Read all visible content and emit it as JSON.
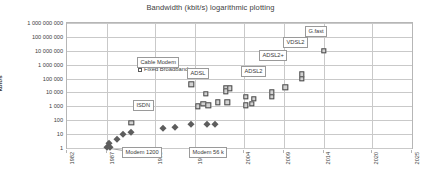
{
  "chart_data": {
    "type": "scatter",
    "title": "Bandwidth (kbit/s) logarithmic plotting",
    "xlabel": "",
    "ylabel": "kbit/s",
    "yscale": "log",
    "ylim": [
      1,
      1000000000
    ],
    "xlim": [
      1982,
      2025
    ],
    "grid": true,
    "legend_position": "top-left-inside",
    "ytick_labels": [
      "1 000 000 000",
      "100 000 000",
      "10 000 000",
      "1 000 000",
      "100 000",
      "10 000",
      "1 000",
      "100",
      "10",
      "1"
    ],
    "ytick_values": [
      1000000000,
      100000000,
      10000000,
      1000000,
      100000,
      10000,
      1000,
      100,
      10,
      1
    ],
    "xtick_labels": [
      "1982",
      "1987",
      "1993",
      "1998",
      "2004",
      "2009",
      "2014",
      "2020",
      "2025"
    ],
    "xtick_values": [
      1982,
      1987,
      1993,
      1998,
      2004,
      2009,
      2014,
      2020,
      2025
    ],
    "series": [
      {
        "name": "Modem",
        "marker": "diamond",
        "color": "#5d5d5d",
        "points": [
          {
            "x": 1987.0,
            "y": 1.2
          },
          {
            "x": 1987.2,
            "y": 2.4
          },
          {
            "x": 1987.4,
            "y": 1.2
          },
          {
            "x": 1988.2,
            "y": 4.8
          },
          {
            "x": 1989.0,
            "y": 9.6
          },
          {
            "x": 1990.0,
            "y": 14.4
          },
          {
            "x": 1994.0,
            "y": 28.8
          },
          {
            "x": 1995.5,
            "y": 33.6
          },
          {
            "x": 1997.5,
            "y": 56.0
          },
          {
            "x": 1999.5,
            "y": 56.0
          },
          {
            "x": 2000.5,
            "y": 56.0
          }
        ]
      },
      {
        "name": "Fixed Broadband",
        "marker": "square",
        "color": "#d2d2d2",
        "points": [
          {
            "x": 1990.0,
            "y": 64
          },
          {
            "x": 1997.5,
            "y": 38000
          },
          {
            "x": 1998.3,
            "y": 1000
          },
          {
            "x": 1999.0,
            "y": 1500
          },
          {
            "x": 1999.3,
            "y": 8000
          },
          {
            "x": 1999.6,
            "y": 1200
          },
          {
            "x": 2000.8,
            "y": 2000
          },
          {
            "x": 2001.8,
            "y": 20000
          },
          {
            "x": 2001.8,
            "y": 12000
          },
          {
            "x": 2002.3,
            "y": 20000
          },
          {
            "x": 2002.0,
            "y": 2000
          },
          {
            "x": 2004.3,
            "y": 5000
          },
          {
            "x": 2004.3,
            "y": 1200
          },
          {
            "x": 2005.0,
            "y": 1500
          },
          {
            "x": 2005.3,
            "y": 3500
          },
          {
            "x": 2007.5,
            "y": 10000
          },
          {
            "x": 2007.5,
            "y": 5000
          },
          {
            "x": 2009.2,
            "y": 24000
          },
          {
            "x": 2011.3,
            "y": 200000
          },
          {
            "x": 2011.3,
            "y": 100000
          },
          {
            "x": 2014.0,
            "y": 10000000
          }
        ]
      }
    ],
    "annotations": [
      {
        "label": "Cable Modem",
        "target_x": 1997.5,
        "target_y": 38000
      },
      {
        "label": "ADSL",
        "target_x": 1999.3,
        "target_y": 8000
      },
      {
        "label": "ISDN",
        "target_x": 1990.0,
        "target_y": 64
      },
      {
        "label": "Modem 1200",
        "target_x": 1987.0,
        "target_y": 1.2
      },
      {
        "label": "Modem 56 k",
        "target_x": 1997.5,
        "target_y": 56
      },
      {
        "label": "ADSL2",
        "target_x": 2004.3,
        "target_y": 5000
      },
      {
        "label": "ADSL2+",
        "target_x": 2007.5,
        "target_y": 10000
      },
      {
        "label": "VDSL2",
        "target_x": 2011.3,
        "target_y": 200000
      },
      {
        "label": "G.fast",
        "target_x": 2014.0,
        "target_y": 10000000
      }
    ]
  },
  "legend": {
    "items": [
      {
        "label": "Modem",
        "marker": "diamond"
      },
      {
        "label": "Fixed Broadband",
        "marker": "square"
      }
    ]
  }
}
